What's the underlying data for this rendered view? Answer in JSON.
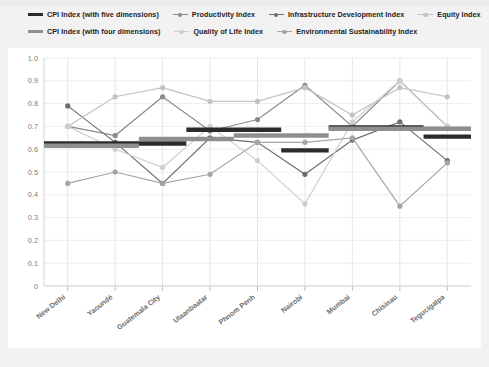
{
  "legend": {
    "rows": [
      [
        {
          "label": "CPI Index (with five dimensions)",
          "marker": "bar",
          "color": "#2b2b2b"
        },
        {
          "label": "Productivity Index",
          "marker": "line-dot",
          "color": "#8a8a8a"
        },
        {
          "label": "Infrastructure Development Index",
          "marker": "line-dot",
          "color": "#6e6e6e"
        },
        {
          "label": "Equity Index",
          "marker": "line-dot",
          "color": "#c2c2c2"
        }
      ],
      [
        {
          "label": "CPI Index (with four dimensions)",
          "marker": "bar",
          "color": "#8f8f8f"
        },
        {
          "label": "Quality of Life Index",
          "marker": "line-dot",
          "color": "#cfcfcf"
        },
        {
          "label": "Environmental Sustainability Index",
          "marker": "line-dot",
          "color": "#a5a5a5"
        }
      ]
    ]
  },
  "chart_data": {
    "type": "line",
    "title": "",
    "xlabel": "",
    "ylabel": "",
    "ylim": [
      0,
      1.0
    ],
    "yticks": [
      "0",
      "0.1",
      "0.2",
      "0.3",
      "0.4",
      "0.5",
      "0.6",
      "0.7",
      "0.8",
      "0.9",
      "1.0"
    ],
    "grid": true,
    "legend_position": "top",
    "categories": [
      "New Delhi",
      "Yaoundé",
      "Guatemala City",
      "Ulaanbaatar",
      "Phnom Penh",
      "Nairobi",
      "Mumbai",
      "Chisinau",
      "Tegucigalpa"
    ],
    "series": [
      {
        "name": "CPI Index (with five dimensions)",
        "type": "step-bar",
        "color": "#2b2b2b",
        "values": [
          0.625,
          0.625,
          0.625,
          0.685,
          0.685,
          0.595,
          0.695,
          0.695,
          0.655
        ]
      },
      {
        "name": "CPI Index (with four dimensions)",
        "type": "step-bar",
        "color": "#8f8f8f",
        "values": [
          0.615,
          0.615,
          0.645,
          0.645,
          0.66,
          0.66,
          0.69,
          0.69,
          0.69
        ]
      },
      {
        "name": "Productivity Index",
        "type": "line-dot",
        "color": "#8a8a8a",
        "values": [
          0.7,
          0.66,
          0.83,
          0.68,
          0.73,
          0.88,
          0.7,
          0.9,
          0.7
        ]
      },
      {
        "name": "Infrastructure Development Index",
        "type": "line-dot",
        "color": "#6e6e6e",
        "values": [
          0.79,
          0.63,
          0.45,
          0.65,
          0.63,
          0.49,
          0.64,
          0.72,
          0.55
        ]
      },
      {
        "name": "Equity Index",
        "type": "line-dot",
        "color": "#c2c2c2",
        "values": [
          0.7,
          0.83,
          0.87,
          0.81,
          0.81,
          0.87,
          0.75,
          0.87,
          0.83
        ]
      },
      {
        "name": "Quality of Life Index",
        "type": "line-dot",
        "color": "#cfcfcf",
        "values": [
          0.7,
          0.6,
          0.52,
          0.7,
          0.55,
          0.36,
          0.72,
          0.9,
          0.7
        ]
      },
      {
        "name": "Environmental Sustainability Index",
        "type": "line-dot",
        "color": "#a5a5a5",
        "values": [
          0.45,
          0.5,
          0.45,
          0.49,
          0.63,
          0.63,
          0.65,
          0.35,
          0.54
        ]
      }
    ]
  }
}
